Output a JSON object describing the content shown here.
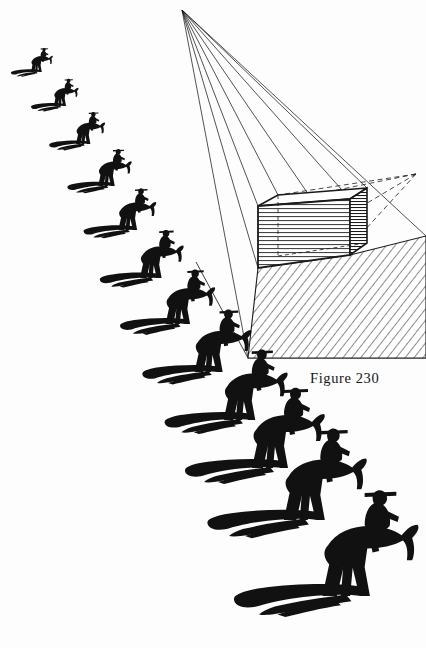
{
  "figure": {
    "caption": "Figure 230",
    "title": "Figure 230",
    "medium": "pen-and-ink line drawing",
    "ink_color": "#111111",
    "paper_color": "#fdfdfd"
  },
  "diagram": {
    "light_source_label": "light source point",
    "vanishing_point_label": "vanishing point",
    "box_label": "rectangular box",
    "cast_shadow_label": "cast shadow",
    "light_rays_count": 7,
    "dashed_rays_count": 4,
    "light_source": {
      "x": 182,
      "y": 10
    },
    "vanishing_point": {
      "x": 416,
      "y": 174
    },
    "box": {
      "front_top_left": {
        "x": 258,
        "y": 206
      },
      "front_top_right": {
        "x": 350,
        "y": 199
      },
      "front_bot_right": {
        "x": 350,
        "y": 255
      },
      "front_bot_left": {
        "x": 258,
        "y": 268
      },
      "back_top_left": {
        "x": 278,
        "y": 195
      },
      "back_top_right": {
        "x": 367,
        "y": 188
      },
      "back_bot_right": {
        "x": 367,
        "y": 243
      },
      "hatch_spacing": 4
    },
    "shadow_polygon": [
      {
        "x": 258,
        "y": 268
      },
      {
        "x": 350,
        "y": 255
      },
      {
        "x": 426,
        "y": 236
      },
      {
        "x": 426,
        "y": 358
      },
      {
        "x": 248,
        "y": 358
      }
    ],
    "ground_plane_edges": [
      {
        "x1": 196,
        "y1": 262,
        "x2": 248,
        "y2": 358
      },
      {
        "x1": 248,
        "y1": 358,
        "x2": 426,
        "y2": 358
      }
    ]
  },
  "riders": {
    "label": "mounted rider silhouettes receding in perspective",
    "count": 12,
    "description": "horse and rider figures with cast shadows, increasing in scale from upper-left to lower-right",
    "items": [
      {
        "index": 1,
        "x": 40,
        "y": 72,
        "scale": 0.3,
        "shadow_len": 30
      },
      {
        "index": 2,
        "x": 62,
        "y": 104,
        "scale": 0.34,
        "shadow_len": 34
      },
      {
        "index": 3,
        "x": 84,
        "y": 140,
        "scale": 0.4,
        "shadow_len": 42
      },
      {
        "index": 4,
        "x": 108,
        "y": 180,
        "scale": 0.46,
        "shadow_len": 50
      },
      {
        "index": 5,
        "x": 128,
        "y": 222,
        "scale": 0.52,
        "shadow_len": 58
      },
      {
        "index": 6,
        "x": 150,
        "y": 268,
        "scale": 0.6,
        "shadow_len": 68
      },
      {
        "index": 7,
        "x": 176,
        "y": 312,
        "scale": 0.68,
        "shadow_len": 80
      },
      {
        "index": 8,
        "x": 208,
        "y": 358,
        "scale": 0.78,
        "shadow_len": 92
      },
      {
        "index": 9,
        "x": 238,
        "y": 404,
        "scale": 0.88,
        "shadow_len": 106
      },
      {
        "index": 10,
        "x": 268,
        "y": 452,
        "scale": 1.0,
        "shadow_len": 122
      },
      {
        "index": 11,
        "x": 302,
        "y": 500,
        "scale": 1.14,
        "shadow_len": 140
      },
      {
        "index": 12,
        "x": 348,
        "y": 556,
        "scale": 1.32,
        "shadow_len": 164
      }
    ]
  }
}
